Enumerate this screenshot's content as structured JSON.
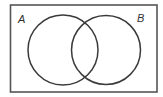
{
  "diagram": {
    "type": "venn",
    "universe": {
      "x": 10,
      "y": 5,
      "width": 147,
      "height": 87,
      "stroke": "#444444"
    },
    "sets": [
      {
        "label": "A",
        "cx": 63,
        "cy": 50,
        "r": 35,
        "label_x": 18,
        "label_y": 23
      },
      {
        "label": "B",
        "cx": 106,
        "cy": 50,
        "r": 35,
        "label_x": 138,
        "label_y": 22
      }
    ],
    "stroke_color": "#3a3a3a",
    "background": "#ffffff"
  }
}
